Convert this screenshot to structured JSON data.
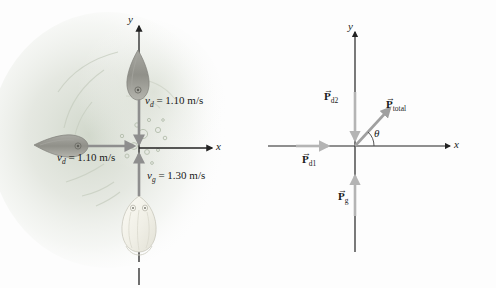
{
  "figure": {
    "background_color": "#fdfdfd",
    "axis_color": "#222222",
    "arrow_gray": "#8e8e8e",
    "arrow_light_gray": "#b9b9b9",
    "water_tint": "#d9ded4"
  },
  "left_panel": {
    "name": "physical-scene",
    "axes": {
      "x_label": "x",
      "y_label": "y"
    },
    "velocity_labels": [
      {
        "id": "v-dolphin-top",
        "symbol": "v",
        "subscript": "d",
        "equals": "=",
        "value": "1.10",
        "units": "m/s",
        "text": "v_d = 1.10 m/s",
        "direction": "down"
      },
      {
        "id": "v-dolphin-left",
        "symbol": "v",
        "subscript": "d",
        "equals": "=",
        "value": "1.10",
        "units": "m/s",
        "text": "v_d = 1.10 m/s",
        "direction": "right"
      },
      {
        "id": "v-goldfish-bottom",
        "symbol": "v",
        "subscript": "g",
        "equals": "=",
        "value": "1.30",
        "units": "m/s",
        "text": "v_g = 1.30 m/s",
        "direction": "up"
      }
    ],
    "creatures": [
      {
        "id": "dolphin-top",
        "kind": "dolphin",
        "color": "#9a9a94",
        "heading": "down"
      },
      {
        "id": "dolphin-left",
        "kind": "dolphin",
        "color": "#9a9a94",
        "heading": "right"
      },
      {
        "id": "goldfish",
        "kind": "goldfish",
        "color": "#f2f1ea",
        "heading": "up"
      }
    ]
  },
  "right_panel": {
    "name": "momentum-vector-diagram",
    "axes": {
      "x_label": "x",
      "y_label": "y"
    },
    "vectors": [
      {
        "id": "p-d2",
        "label": "P",
        "subscript": "d2",
        "text": "P_d2",
        "direction": "down",
        "color": "#b4b4b4"
      },
      {
        "id": "p-d1",
        "label": "P",
        "subscript": "d1",
        "text": "P_d1",
        "direction": "right",
        "color": "#b4b4b4"
      },
      {
        "id": "p-g",
        "label": "P",
        "subscript": "g",
        "text": "P_g",
        "direction": "up",
        "color": "#b4b4b4"
      },
      {
        "id": "p-total",
        "label": "P",
        "subscript": "total",
        "text": "P_total",
        "direction": "up-right",
        "color": "#a9a9a9"
      }
    ],
    "angle": {
      "id": "theta",
      "symbol": "θ"
    }
  }
}
